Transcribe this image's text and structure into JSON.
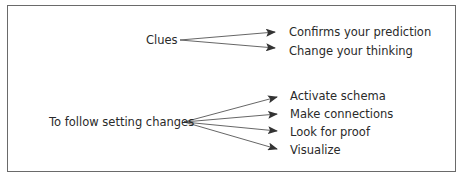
{
  "diagram": {
    "groups": [
      {
        "source": "Clues",
        "targets": [
          "Confirms your prediction",
          "Change your thinking"
        ]
      },
      {
        "source": "To follow setting changes",
        "targets": [
          "Activate schema",
          "Make connections",
          "Look for proof",
          "Visualize"
        ]
      }
    ]
  },
  "colors": {
    "border": "#6a6a6a",
    "text": "#2a2a2a",
    "arrow": "#333333"
  }
}
